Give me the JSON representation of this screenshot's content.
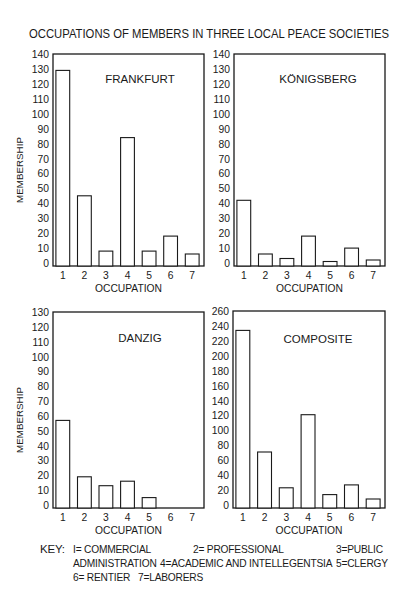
{
  "title": "OCCUPATIONS OF MEMBERS IN THREE LOCAL PEACE SOCIETIES",
  "chart_data": [
    {
      "type": "bar",
      "panel": "top-left",
      "title": "FRANKFURT",
      "xlabel": "OCCUPATION",
      "ylabel": "MEMBERSHIP",
      "categories": [
        "1",
        "2",
        "3",
        "4",
        "5",
        "6",
        "7"
      ],
      "values": [
        129,
        45,
        8,
        84,
        8,
        18,
        6
      ],
      "ylim": [
        0,
        140
      ],
      "yticks": [
        "0",
        "10",
        "20",
        "30",
        "40",
        "50",
        "60",
        "70",
        "80",
        "90",
        "100",
        "110",
        "120",
        "130",
        "140"
      ],
      "ytick_values": [
        0,
        10,
        20,
        30,
        40,
        50,
        60,
        70,
        80,
        90,
        100,
        110,
        120,
        130,
        140
      ],
      "grid": false
    },
    {
      "type": "bar",
      "panel": "top-right",
      "title": "KÖNIGSBERG",
      "xlabel": "OCCUPATION",
      "ylabel": "",
      "categories": [
        "1",
        "2",
        "3",
        "4",
        "5",
        "6",
        "7"
      ],
      "values": [
        42,
        6,
        3,
        18,
        1,
        10,
        2
      ],
      "ylim": [
        0,
        140
      ],
      "yticks": [
        "0",
        "10",
        "20",
        "30",
        "40",
        "50",
        "60",
        "70",
        "80",
        "90",
        "100",
        "110",
        "120",
        "130",
        "140"
      ],
      "ytick_values": [
        0,
        10,
        20,
        30,
        40,
        50,
        60,
        70,
        80,
        90,
        100,
        110,
        120,
        130,
        140
      ],
      "grid": false
    },
    {
      "type": "bar",
      "panel": "bottom-left",
      "title": "DANZIG",
      "xlabel": "OCCUPATION",
      "ylabel": "MEMBERSHIP",
      "categories": [
        "1",
        "2",
        "3",
        "4",
        "5",
        "6",
        "7"
      ],
      "values": [
        57,
        19,
        13,
        16,
        5,
        0,
        0
      ],
      "ylim": [
        0,
        130
      ],
      "yticks": [
        "0",
        "10",
        "20",
        "30",
        "40",
        "50",
        "60",
        "70",
        "80",
        "90",
        "100",
        "110",
        "120",
        "130"
      ],
      "ytick_values": [
        0,
        10,
        20,
        30,
        40,
        50,
        60,
        70,
        80,
        90,
        100,
        110,
        120,
        130
      ],
      "grid": false
    },
    {
      "type": "bar",
      "panel": "bottom-right",
      "title": "COMPOSITE",
      "xlabel": "OCCUPATION",
      "ylabel": "",
      "categories": [
        "1",
        "2",
        "3",
        "4",
        "5",
        "6",
        "7"
      ],
      "values": [
        234,
        71,
        23,
        121,
        14,
        27,
        8
      ],
      "ylim": [
        0,
        260
      ],
      "yticks": [
        "0",
        "20",
        "40",
        "60",
        "80",
        "100",
        "120",
        "140",
        "160",
        "180",
        "200",
        "220",
        "240",
        "260"
      ],
      "ytick_values": [
        0,
        20,
        40,
        60,
        80,
        100,
        120,
        140,
        160,
        180,
        200,
        220,
        240,
        260
      ],
      "grid": false
    }
  ],
  "key": {
    "label": "KEY:",
    "line1": [
      "I= COMMERCIAL",
      "2= PROFESSIONAL",
      "3=PUBLIC"
    ],
    "line2": [
      "ADMINISTRATION",
      "4=ACADEMIC AND INTELLEGENTSIA",
      "5=CLERGY"
    ],
    "line3": [
      "6= RENTIER",
      "7=LABORERS"
    ]
  }
}
